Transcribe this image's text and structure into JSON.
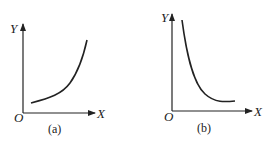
{
  "panels": [
    {
      "id": "a",
      "caption": "(a)",
      "y_label": "Y",
      "x_label": "X",
      "origin_label": "O",
      "curve": "increasing convex (exponential growth)"
    },
    {
      "id": "b",
      "caption": "(b)",
      "y_label": "Y",
      "x_label": "X",
      "origin_label": "O",
      "curve": "decreasing convex (exponential decay)"
    }
  ]
}
